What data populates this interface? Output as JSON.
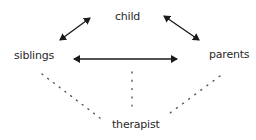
{
  "diagram": {
    "nodes": [
      {
        "id": "child",
        "label": "child"
      },
      {
        "id": "siblings",
        "label": "siblings"
      },
      {
        "id": "parents",
        "label": "parents"
      },
      {
        "id": "therapist",
        "label": "therapist"
      }
    ],
    "edges": [
      {
        "from": "siblings",
        "to": "child",
        "style": "solid",
        "arrows": "both"
      },
      {
        "from": "child",
        "to": "parents",
        "style": "solid",
        "arrows": "both"
      },
      {
        "from": "siblings",
        "to": "parents",
        "style": "solid",
        "arrows": "both"
      },
      {
        "from": "siblings",
        "to": "therapist",
        "style": "dotted",
        "arrows": "none"
      },
      {
        "from": "child",
        "to": "therapist",
        "style": "dotted",
        "arrows": "none"
      },
      {
        "from": "parents",
        "to": "therapist",
        "style": "dotted",
        "arrows": "none"
      }
    ],
    "colors": {
      "line": "#1a1a1a",
      "text": "#2a2a2a",
      "dots": "#555555",
      "background": "#ffffff"
    }
  }
}
